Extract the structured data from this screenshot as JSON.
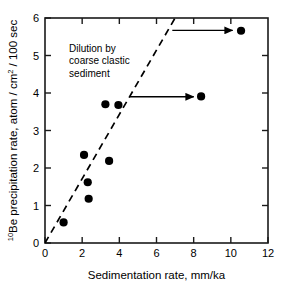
{
  "chart_data": {
    "type": "scatter",
    "title": "",
    "xlabel": "Sedimentation rate, mm/ka",
    "ylabel": "10Be precipitation rate, atom / cm2 / 100 sec",
    "ylabel_parts": {
      "sup1": "10",
      "text1": "Be precipitation rate, atom / cm",
      "sup2": "2",
      "text2": " / 100 sec"
    },
    "xlim": [
      0,
      12
    ],
    "ylim": [
      0,
      6
    ],
    "xticks": [
      0,
      2,
      4,
      6,
      8,
      10,
      12
    ],
    "yticks": [
      0,
      1,
      2,
      3,
      4,
      5,
      6
    ],
    "xtick_labels": [
      "0",
      "2",
      "4",
      "6",
      "8",
      "10",
      "12"
    ],
    "ytick_labels": [
      "0",
      "1",
      "2",
      "3",
      "4",
      "5",
      "6"
    ],
    "grid": false,
    "legend": false,
    "marker": "filled-circle",
    "marker_color": "#000000",
    "points": [
      {
        "x": 1.0,
        "y": 0.55
      },
      {
        "x": 2.1,
        "y": 2.35
      },
      {
        "x": 2.3,
        "y": 1.62
      },
      {
        "x": 2.35,
        "y": 1.18
      },
      {
        "x": 3.25,
        "y": 3.7
      },
      {
        "x": 3.45,
        "y": 2.19
      },
      {
        "x": 3.95,
        "y": 3.68
      },
      {
        "x": 8.4,
        "y": 3.91
      },
      {
        "x": 10.55,
        "y": 5.66
      }
    ],
    "trend_line": {
      "style": "dashed",
      "color": "#000000",
      "from": {
        "x": 0,
        "y": 0
      },
      "to": {
        "x": 7.0,
        "y": 6.0
      }
    },
    "annotations": [
      {
        "name": "dilution-note",
        "lines": [
          "Dilution by",
          "coarse clastic",
          "sediment"
        ],
        "x": 7.0,
        "y": 5.1
      }
    ],
    "arrows": [
      {
        "name": "arrow-to-top-right-point",
        "x1": 6.85,
        "y1": 5.67,
        "x2": 10.1,
        "y2": 5.67
      },
      {
        "name": "arrow-to-mid-right-point",
        "x1": 4.55,
        "y1": 3.9,
        "x2": 8.0,
        "y2": 3.9
      }
    ]
  }
}
